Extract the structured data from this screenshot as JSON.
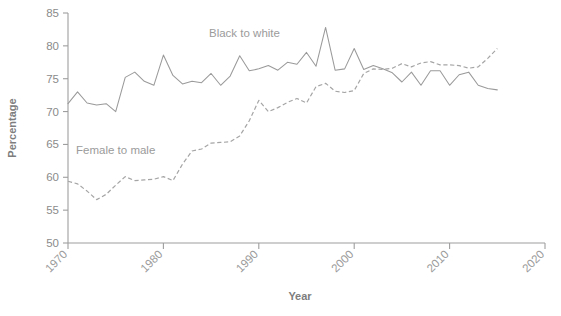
{
  "chart_data": {
    "type": "line",
    "title": "",
    "xlabel": "Year",
    "ylabel": "Percentage",
    "xlim": [
      1970,
      2020
    ],
    "ylim": [
      50,
      85
    ],
    "grid": false,
    "legend_position": "inline-annotations",
    "xticks": [
      1970,
      1980,
      1990,
      2000,
      2010,
      2020
    ],
    "yticks": [
      50,
      55,
      60,
      65,
      70,
      75,
      80,
      85
    ],
    "x": [
      1970,
      1971,
      1972,
      1973,
      1974,
      1975,
      1976,
      1977,
      1978,
      1979,
      1980,
      1981,
      1982,
      1983,
      1984,
      1985,
      1986,
      1987,
      1988,
      1989,
      1990,
      1991,
      1992,
      1993,
      1994,
      1995,
      1996,
      1997,
      1998,
      1999,
      2000,
      2001,
      2002,
      2003,
      2004,
      2005,
      2006,
      2007,
      2008,
      2009,
      2010,
      2011,
      2012,
      2013,
      2014,
      2015
    ],
    "series": [
      {
        "name": "Black to white",
        "style": "solid",
        "color": "#9a9a9a",
        "label_text": "Black to white",
        "values": [
          71.2,
          73.0,
          71.3,
          71.0,
          71.2,
          70.0,
          75.2,
          76.0,
          74.6,
          74.0,
          78.6,
          75.5,
          74.2,
          74.6,
          74.4,
          75.8,
          74.0,
          75.4,
          78.5,
          76.2,
          76.5,
          77.0,
          76.3,
          77.5,
          77.2,
          79.0,
          76.9,
          82.8,
          76.3,
          76.5,
          79.6,
          76.4,
          77.0,
          76.5,
          75.9,
          74.5,
          76.0,
          74.0,
          76.2,
          76.2,
          74.0,
          75.6,
          76.0,
          74.0,
          73.5,
          73.3
        ]
      },
      {
        "name": "Female to male",
        "style": "dashed",
        "color": "#a5a5a5",
        "label_text": "Female to male",
        "values": [
          59.4,
          59.0,
          57.9,
          56.6,
          57.4,
          58.8,
          60.1,
          59.5,
          59.6,
          59.7,
          60.1,
          59.5,
          62.0,
          64.0,
          64.3,
          65.2,
          65.3,
          65.4,
          66.3,
          68.6,
          71.7,
          70.0,
          70.6,
          71.4,
          72.0,
          71.3,
          73.8,
          74.3,
          73.1,
          72.9,
          73.2,
          75.8,
          76.5,
          76.4,
          76.6,
          77.3,
          76.8,
          77.4,
          77.6,
          77.1,
          77.1,
          77.0,
          76.6,
          76.8,
          78.1,
          79.6
        ]
      }
    ],
    "annotations": [
      {
        "text": "Black to white",
        "x": 1988.5,
        "y": 81.3
      },
      {
        "text": "Female to male",
        "x": 1975.0,
        "y": 63.5
      }
    ]
  }
}
